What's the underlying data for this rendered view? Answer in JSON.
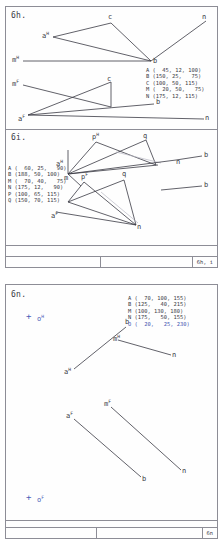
{
  "sheets": [
    {
      "panels": [
        {
          "title": "6h.",
          "coords": [
            "A (  45, 12, 100)",
            "B (150, 25,   75)",
            "C (100, 50, 115)",
            "M (  20, 50,   75)",
            "N (175, 12, 115)"
          ],
          "labels": [
            "a",
            "m",
            "c",
            "n",
            "b",
            "m",
            "c",
            "b",
            "a",
            "n"
          ],
          "sups": [
            "H",
            "H",
            "",
            "",
            "",
            "F",
            "",
            "",
            "F",
            ""
          ]
        },
        {
          "title": "6i.",
          "coords": [
            "A (  60, 25,   90)",
            "B (188, 50, 100)",
            "M (  70, 40,   75)",
            "N (175, 12,   90)",
            "P (100, 65, 115)",
            "Q (150, 70, 115)"
          ],
          "labels": [
            "a",
            "p",
            "q",
            "b",
            "n",
            "m",
            "p",
            "q",
            "b",
            "a",
            "n"
          ],
          "sups": [
            "H",
            "H",
            "",
            "",
            "",
            "",
            "F",
            "",
            "",
            "F",
            ""
          ]
        }
      ],
      "footer_label": "6h, i"
    },
    {
      "panels": [
        {
          "title": "6n.",
          "coords": [
            "A (  70, 100, 155)",
            "B (125,   40, 215)",
            "M (100, 130, 180)",
            "N (175,   50, 155)"
          ],
          "coord_highlight": "O (  20,   25, 230)",
          "labels": [
            "o",
            "b",
            "m",
            "a",
            "n",
            "m",
            "a",
            "b",
            "n",
            "o"
          ],
          "sups": [
            "H",
            "",
            "H",
            "H",
            "",
            "F",
            "F",
            "",
            "",
            "F"
          ],
          "plus_marks": [
            "+",
            "+"
          ]
        }
      ],
      "footer_label": "6n"
    }
  ],
  "colors": {
    "ink": "#3a3a44",
    "rule": "#8d8d96",
    "highlight": "#3f52b0",
    "dashed": "#b9b9c4",
    "paper": "#fefefe"
  }
}
